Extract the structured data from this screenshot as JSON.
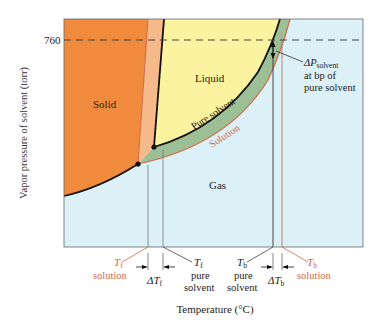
{
  "diagram": {
    "y_axis_label": "Vapor pressure of solvent (torr)",
    "x_axis_label": "Temperature (°C)",
    "y_tick": "760",
    "regions": {
      "solid": "Solid",
      "liquid": "Liquid",
      "gas": "Gas"
    },
    "curves": {
      "pure_solvent": "Pure solvent",
      "solution": "Solution"
    },
    "annotation": {
      "delta_p_line1": "ΔP",
      "delta_p_sub": "solvent",
      "delta_p_line2": "at bp of",
      "delta_p_line3": "pure solvent"
    },
    "x_markers": {
      "tf_solution": {
        "symbol": "T",
        "sub": "f",
        "label": "solution"
      },
      "delta_tf": {
        "symbol": "ΔT",
        "sub": "f"
      },
      "tf_pure": {
        "symbol": "T",
        "sub": "f",
        "label1": "pure",
        "label2": "solvent"
      },
      "tb_pure": {
        "symbol": "T",
        "sub": "b",
        "label1": "pure",
        "label2": "solvent"
      },
      "delta_tb": {
        "symbol": "ΔT",
        "sub": "b"
      },
      "tb_solution": {
        "symbol": "T",
        "sub": "b",
        "label": "solution"
      }
    },
    "colors": {
      "solid": "#f08a3c",
      "solid_solution_band": "#f5b98a",
      "liquid": "#fbf3a0",
      "gas": "#dcf0f8",
      "green_band": "#9dbf95",
      "solution_line": "#d46a4a",
      "pure_line": "#111111",
      "solution_text": "#d9673f"
    }
  }
}
